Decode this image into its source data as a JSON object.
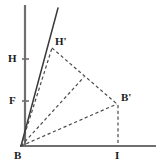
{
  "figure": {
    "type": "geometry-diagram",
    "title": "",
    "canvas": {
      "width": 163,
      "height": 166,
      "background": "#ffffff"
    },
    "colors": {
      "axis": "#6f6f6f",
      "solid_line": "#3a3a3a",
      "dashed_line": "#4a4a4a",
      "label_text": "#1a1a1a",
      "tick": "#6f6f6f"
    },
    "points": [
      {
        "id": "B",
        "label": "B",
        "x": 21,
        "y": 146,
        "label_x": 14,
        "label_y": 150
      },
      {
        "id": "H",
        "label": "H",
        "x": 25,
        "y": 59,
        "label_x": 8,
        "label_y": 53
      },
      {
        "id": "F",
        "label": "F",
        "x": 25,
        "y": 101,
        "label_x": 9,
        "label_y": 95
      },
      {
        "id": "Hp",
        "label": "H'",
        "x": 52,
        "y": 47,
        "label_x": 55,
        "label_y": 36
      },
      {
        "id": "Bp",
        "label": "B'",
        "x": 118,
        "y": 104,
        "label_x": 121,
        "label_y": 92
      },
      {
        "id": "I",
        "label": "I",
        "x": 118,
        "y": 146,
        "label_x": 115,
        "label_y": 150
      }
    ],
    "axes": {
      "vertical": {
        "from": [
          25,
          5
        ],
        "to": [
          25,
          147
        ],
        "style": "solid",
        "weight": 2.2
      },
      "horizontal": {
        "from": [
          20,
          146
        ],
        "to": [
          156,
          146
        ],
        "style": "solid",
        "weight": 2.2
      }
    },
    "ticks": [
      {
        "at": "H",
        "x": 25,
        "y": 59,
        "half_length": 3
      },
      {
        "at": "F",
        "x": 25,
        "y": 101,
        "half_length": 3
      }
    ],
    "segments": [
      {
        "id": "ray-B-top",
        "name": "solid-ray-from-B",
        "from": [
          21,
          146
        ],
        "to": [
          58,
          8
        ],
        "style": "solid"
      },
      {
        "id": "seg-B-Hp",
        "name": "dashed-B-to-Hprime",
        "from": [
          21,
          146
        ],
        "to": [
          52,
          47
        ],
        "style": "dashed"
      },
      {
        "id": "seg-B-mid",
        "name": "dashed-B-to-crossing",
        "from": [
          21,
          146
        ],
        "to": [
          83,
          78
        ],
        "style": "dashed"
      },
      {
        "id": "seg-B-Bp",
        "name": "dashed-B-to-Bprime",
        "from": [
          21,
          146
        ],
        "to": [
          118,
          104
        ],
        "style": "dashed"
      },
      {
        "id": "seg-Hp-Bp",
        "name": "dashed-Hprime-to-Bprime",
        "from": [
          52,
          47
        ],
        "to": [
          118,
          104
        ],
        "style": "dashed"
      },
      {
        "id": "seg-Bp-I",
        "name": "dashed-Bprime-to-I",
        "from": [
          118,
          104
        ],
        "to": [
          118,
          146
        ],
        "style": "dashed"
      }
    ]
  }
}
